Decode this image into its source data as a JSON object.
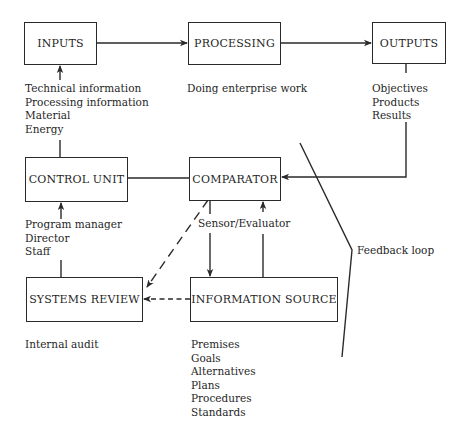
{
  "diagram": {
    "boxes": {
      "inputs": "INPUTS",
      "processing": "PROCESSING",
      "outputs": "OUTPUTS",
      "control_unit": "CONTROL UNIT",
      "comparator": "COMPARATOR",
      "systems_review": "SYSTEMS REVIEW",
      "information_source": "INFORMATION SOURCE"
    },
    "labels": {
      "inputs_items": [
        "Technical information",
        "Processing information",
        "Material",
        "Energy"
      ],
      "processing_desc": "Doing enterprise work",
      "outputs_items": [
        "Objectives",
        "Products",
        "Results"
      ],
      "control_unit_items": [
        "Program manager",
        "Director",
        "Staff"
      ],
      "sensor": "Sensor/Evaluator",
      "feedback": "Feedback loop",
      "systems_review_desc": "Internal audit",
      "information_source_items": [
        "Premises",
        "Goals",
        "Alternatives",
        "Plans",
        "Procedures",
        "Standards"
      ]
    },
    "colors": {
      "line": "#2a2a2a",
      "background": "#ffffff"
    }
  }
}
